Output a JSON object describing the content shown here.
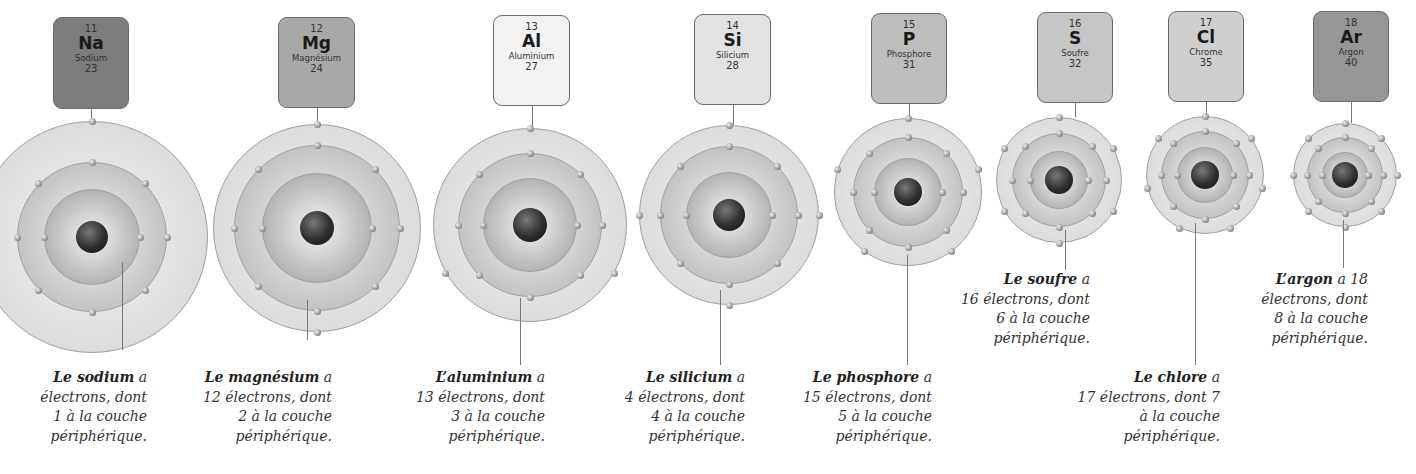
{
  "elements": [
    {
      "number": "11",
      "symbol": "Na",
      "name": "Sodium",
      "mass": "23",
      "box_color": "#7d7d7d",
      "caption": {
        "bold": "Le sodium",
        "rest": " a",
        "line2": "électrons, dont",
        "line3": "1 à la couche",
        "line4": "périphérique."
      },
      "electrons": "11",
      "outer": "1"
    },
    {
      "number": "12",
      "symbol": "Mg",
      "name": "Magnésium",
      "mass": "24",
      "box_color": "#a8a8a8",
      "caption": {
        "bold": "Le magnésium",
        "rest": " a",
        "line2": "12 électrons, dont",
        "line3": "2 à la couche",
        "line4": "périphérique."
      },
      "electrons": "12",
      "outer": "2"
    },
    {
      "number": "13",
      "symbol": "Al",
      "name": "Aluminium",
      "mass": "27",
      "box_color": "#f2f2f2",
      "caption": {
        "bold": "L’aluminium",
        "rest": " a",
        "line2": "13 électrons, dont",
        "line3": "3 à la couche",
        "line4": "périphérique."
      },
      "electrons": "13",
      "outer": "3"
    },
    {
      "number": "14",
      "symbol": "Si",
      "name": "Silicium",
      "mass": "28",
      "box_color": "#e2e2e2",
      "caption": {
        "bold": "Le silicium",
        "rest": " a",
        "line2": "4 électrons, dont",
        "line3": "4 à la couche",
        "line4": "périphérique."
      },
      "electrons": "14",
      "outer": "4"
    },
    {
      "number": "15",
      "symbol": "P",
      "name": "Phosphore",
      "mass": "31",
      "box_color": "#bdbdbd",
      "caption": {
        "bold": "Le phosphore",
        "rest": " a",
        "line2": "15 électrons, dont",
        "line3": "5 à la couche",
        "line4": "périphérique."
      },
      "electrons": "15",
      "outer": "5"
    },
    {
      "number": "16",
      "symbol": "S",
      "name": "Soufre",
      "mass": "32",
      "box_color": "#c6c6c6",
      "caption": {
        "bold": "Le soufre",
        "rest": " a",
        "line2": "16 électrons, dont",
        "line3": "6 à la couche",
        "line4": "périphérique."
      },
      "electrons": "16",
      "outer": "6"
    },
    {
      "number": "17",
      "symbol": "Cl",
      "name": "Chrome",
      "mass": "35",
      "box_color": "#cfcfcf",
      "caption": {
        "bold": "Le chlore",
        "rest": " a",
        "line2": "17 électrons, dont 7",
        "line3": "à la couche",
        "line4": "périphérique."
      },
      "electrons": "17",
      "outer": "7"
    },
    {
      "number": "18",
      "symbol": "Ar",
      "name": "Argon",
      "mass": "40",
      "box_color": "#969696",
      "caption": {
        "bold": "L’argon",
        "rest": " a 18",
        "line2": "électrons, dont",
        "line3": "8 à la couche",
        "line4": "périphérique."
      },
      "electrons": "18",
      "outer": "8"
    }
  ],
  "colors": {
    "shell_outer": "#dcdcdc",
    "shell_mid": "#c4c4c4",
    "shell_inner": "#b4b4b4",
    "nucleus": "#2e2e2e",
    "line": "#777777"
  }
}
